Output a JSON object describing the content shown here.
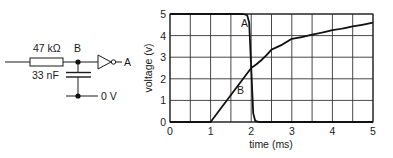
{
  "circuit": {
    "resistor_label": "47 kΩ",
    "capacitor_label": "33 nF",
    "node_b_label": "B",
    "output_label": "A",
    "ground_label": "0 V"
  },
  "chart_data": {
    "type": "line",
    "title": "",
    "xlabel": "time (ms)",
    "ylabel": "voltage (v)",
    "xlim": [
      0,
      5
    ],
    "ylim": [
      0,
      5
    ],
    "x_ticks": [
      "0",
      "1",
      "2",
      "3",
      "4",
      "5"
    ],
    "y_ticks": [
      "0",
      "1",
      "2",
      "3",
      "4",
      "5"
    ],
    "grid": true,
    "grid_x_step": 0.5,
    "grid_y_step": 1,
    "series": [
      {
        "name": "A",
        "label": "A",
        "x": [
          0,
          1.8,
          1.9,
          1.95,
          2.0,
          2.05,
          2.1,
          2.2,
          5
        ],
        "values": [
          5,
          5,
          4.95,
          4.6,
          2.5,
          0.4,
          0.05,
          0,
          0
        ]
      },
      {
        "name": "B",
        "label": "B",
        "x": [
          0,
          1.0,
          1.5,
          2.0,
          2.5,
          3.0,
          3.5,
          4.0,
          4.5,
          5.0
        ],
        "values": [
          0,
          0,
          1.3,
          2.5,
          3.35,
          3.85,
          4.05,
          4.25,
          4.43,
          4.6
        ]
      }
    ],
    "annotations": [
      {
        "text": "A",
        "x": 1.75,
        "y": 4.6
      },
      {
        "text": "B",
        "x": 1.65,
        "y": 1.5
      }
    ]
  }
}
